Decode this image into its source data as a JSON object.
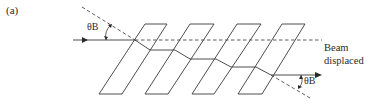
{
  "figure": {
    "panel_label": "(a)",
    "angle_label_incident": "θB",
    "angle_label_exit": "θB",
    "beam_label_line1": "Beam",
    "beam_label_line2": "displaced"
  },
  "diagram": {
    "type": "pile-of-plates polarizer beam displacement",
    "plates": [
      {
        "top": [
          [
            145,
            24
          ],
          [
            167,
            24
          ]
        ],
        "bottom": [
          [
            99,
            94
          ],
          [
            122,
            94
          ]
        ]
      },
      {
        "top": [
          [
            190,
            24
          ],
          [
            214,
            24
          ]
        ],
        "bottom": [
          [
            145,
            94
          ],
          [
            168,
            94
          ]
        ]
      },
      {
        "top": [
          [
            237,
            24
          ],
          [
            261,
            24
          ]
        ],
        "bottom": [
          [
            192,
            94
          ],
          [
            214,
            94
          ]
        ]
      },
      {
        "top": [
          [
            282,
            24
          ],
          [
            305,
            24
          ]
        ],
        "bottom": [
          [
            238,
            94
          ],
          [
            262,
            94
          ]
        ]
      }
    ],
    "beam_path": [
      [
        73,
        40
      ],
      [
        135,
        40
      ],
      [
        150,
        50
      ],
      [
        175,
        50
      ],
      [
        190,
        59
      ],
      [
        216,
        59
      ],
      [
        231,
        67
      ],
      [
        256,
        67
      ],
      [
        271,
        75
      ],
      [
        320,
        75
      ]
    ],
    "reference_line": {
      "from": [
        135,
        40
      ],
      "to": [
        322,
        40
      ],
      "style": "dashed"
    },
    "incident_normal": {
      "from": [
        82,
        7
      ],
      "to": [
        135,
        40
      ],
      "style": "dashed"
    },
    "exit_normal": {
      "from": [
        271,
        75
      ],
      "to": [
        310,
        98
      ],
      "style": "dashed"
    }
  }
}
